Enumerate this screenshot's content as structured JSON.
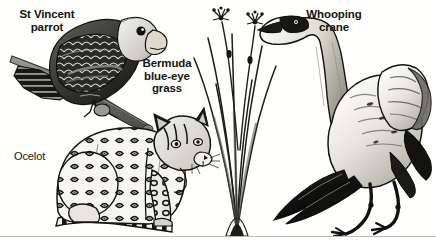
{
  "plate": {
    "title": "Endangered species illustration plate",
    "background_color": "#fefefd",
    "rule_color": "#b9bbb9",
    "ink_color": "#16150f",
    "width": 436,
    "height": 247
  },
  "labels": {
    "parrot": "St Vincent\nparrot",
    "grass": "Bermuda\nblue-eye\ngrass",
    "ocelot": "Ocelot",
    "crane": "Whooping\ncrane"
  },
  "figures": [
    {
      "id": "st-vincent-parrot",
      "name": "St Vincent parrot",
      "kind": "bird",
      "label": "St Vincent\nparrot",
      "description": "Parrot perched on a diagonal branch, dark scalloped plumage with pale head and heavy hooked beak, facing right.",
      "position": {
        "x": 10,
        "y": 4,
        "width": 160,
        "height": 128
      }
    },
    {
      "id": "bermuda-blue-eye-grass",
      "name": "Bermuda blue-eye grass",
      "kind": "plant",
      "label": "Bermuda\nblue-eye\ngrass",
      "description": "Clump of slender arching grass blades with two tall flower stalks bearing small star-shaped blossoms at top.",
      "position": {
        "x": 192,
        "y": 0,
        "width": 90,
        "height": 236
      }
    },
    {
      "id": "ocelot",
      "name": "Ocelot",
      "kind": "mammal",
      "label": "Ocelot",
      "description": "Spotted wild cat sitting in profile facing right, rosette-patterned coat, ringed tail along the ground.",
      "position": {
        "x": 52,
        "y": 108,
        "width": 168,
        "height": 128
      }
    },
    {
      "id": "whooping-crane",
      "name": "Whooping crane",
      "kind": "bird",
      "label": "Whooping\ncrane",
      "description": "Tall crane with long neck extended left, dark-tipped wings raised, standing on long thin legs.",
      "position": {
        "x": 258,
        "y": 2,
        "width": 178,
        "height": 234
      }
    }
  ]
}
